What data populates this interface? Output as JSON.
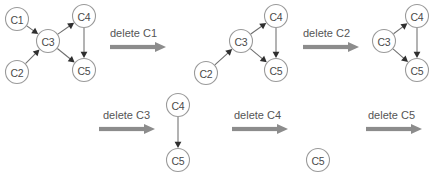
{
  "figure": {
    "kind": "node-deletion-sequence-diagram",
    "background_color": "#ffffff",
    "node_stroke_color": "#9a9a9a",
    "node_fill_color": "#ffffff",
    "node_text_color": "#4a4a4a",
    "edge_color": "#6e6e6e",
    "arrowhead_color": "#2f2f2f",
    "operation_label_color": "#555555",
    "operation_arrow_color": "#8c8c8c",
    "node_radius": 11.5
  },
  "graphs": [
    {
      "id": "graph-1",
      "caption": "",
      "nodes": [
        {
          "id": "C1",
          "label": "C1",
          "cx": 17,
          "cy": 19
        },
        {
          "id": "C2",
          "label": "C2",
          "cx": 17,
          "cy": 72
        },
        {
          "id": "C3",
          "label": "C3",
          "cx": 48,
          "cy": 41
        },
        {
          "id": "C4",
          "label": "C4",
          "cx": 84,
          "cy": 16
        },
        {
          "id": "C5",
          "label": "C5",
          "cx": 84,
          "cy": 70
        }
      ],
      "edges": [
        {
          "from": "C1",
          "to": "C3"
        },
        {
          "from": "C2",
          "to": "C3"
        },
        {
          "from": "C3",
          "to": "C4"
        },
        {
          "from": "C3",
          "to": "C5"
        },
        {
          "from": "C4",
          "to": "C5"
        }
      ]
    },
    {
      "id": "graph-2",
      "caption": "",
      "nodes": [
        {
          "id": "C2",
          "label": "C2",
          "cx": 206,
          "cy": 73
        },
        {
          "id": "C3",
          "label": "C3",
          "cx": 241,
          "cy": 41
        },
        {
          "id": "C4",
          "label": "C4",
          "cx": 276,
          "cy": 16
        },
        {
          "id": "C5",
          "label": "C5",
          "cx": 276,
          "cy": 70
        }
      ],
      "edges": [
        {
          "from": "C2",
          "to": "C3"
        },
        {
          "from": "C3",
          "to": "C4"
        },
        {
          "from": "C3",
          "to": "C5"
        },
        {
          "from": "C4",
          "to": "C5"
        }
      ]
    },
    {
      "id": "graph-3",
      "caption": "",
      "nodes": [
        {
          "id": "C3",
          "label": "C3",
          "cx": 384,
          "cy": 41
        },
        {
          "id": "C4",
          "label": "C4",
          "cx": 417,
          "cy": 16
        },
        {
          "id": "C5",
          "label": "C5",
          "cx": 417,
          "cy": 70
        }
      ],
      "edges": [
        {
          "from": "C3",
          "to": "C4"
        },
        {
          "from": "C3",
          "to": "C5"
        },
        {
          "from": "C4",
          "to": "C5"
        }
      ]
    },
    {
      "id": "graph-4",
      "caption": "",
      "nodes": [
        {
          "id": "C4",
          "label": "C4",
          "cx": 178,
          "cy": 105
        },
        {
          "id": "C5",
          "label": "C5",
          "cx": 178,
          "cy": 160
        }
      ],
      "edges": [
        {
          "from": "C4",
          "to": "C5"
        }
      ]
    },
    {
      "id": "graph-5",
      "caption": "",
      "nodes": [
        {
          "id": "C5",
          "label": "C5",
          "cx": 318,
          "cy": 160
        }
      ],
      "edges": []
    },
    {
      "id": "graph-6",
      "caption": "",
      "nodes": [],
      "edges": []
    }
  ],
  "operations": [
    {
      "id": "op-delete-c1",
      "label": "delete C1",
      "text_x": 110,
      "text_y": 33,
      "arrow_x": 110,
      "arrow_y": 47,
      "arrow_length": 56
    },
    {
      "id": "op-delete-c2",
      "label": "delete C2",
      "text_x": 303,
      "text_y": 33,
      "arrow_x": 303,
      "arrow_y": 47,
      "arrow_length": 56
    },
    {
      "id": "op-delete-c3",
      "label": "delete C3",
      "text_x": 103,
      "text_y": 115,
      "arrow_x": 99,
      "arrow_y": 129,
      "arrow_length": 56
    },
    {
      "id": "op-delete-c4",
      "label": "delete C4",
      "text_x": 234,
      "text_y": 115,
      "arrow_x": 232,
      "arrow_y": 129,
      "arrow_length": 56
    },
    {
      "id": "op-delete-c5",
      "label": "delete C5",
      "text_x": 368,
      "text_y": 115,
      "arrow_x": 366,
      "arrow_y": 129,
      "arrow_length": 56
    }
  ]
}
